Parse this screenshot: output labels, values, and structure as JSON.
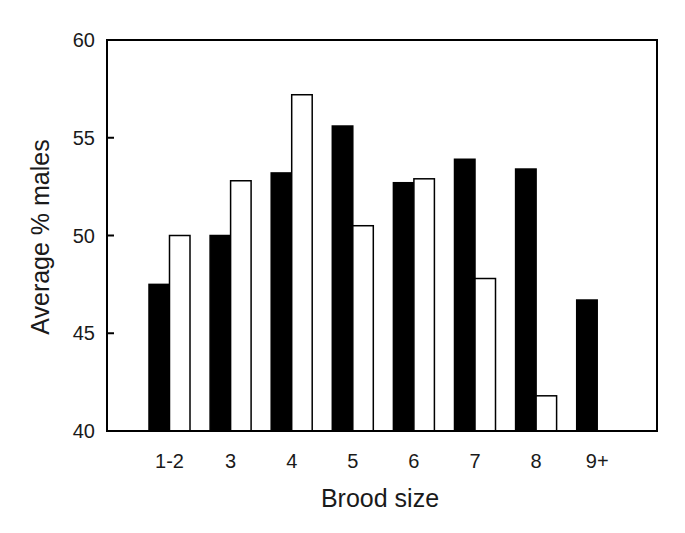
{
  "chart_data": {
    "type": "bar",
    "title": "",
    "xlabel": "Brood size",
    "ylabel": "Average % males",
    "ylim": [
      40,
      60
    ],
    "yticks": [
      40,
      45,
      50,
      55,
      60
    ],
    "grid": false,
    "legend": null,
    "categories": [
      "1-2",
      "3",
      "4",
      "5",
      "6",
      "7",
      "8",
      "9+"
    ],
    "series": [
      {
        "name": "Black bars",
        "fill": "#000000",
        "values": [
          47.5,
          50.0,
          53.2,
          55.6,
          52.7,
          53.9,
          53.4,
          46.7
        ]
      },
      {
        "name": "White bars",
        "fill": "#ffffff",
        "values": [
          50.0,
          52.8,
          57.2,
          50.5,
          52.9,
          47.8,
          41.8,
          null
        ]
      }
    ]
  },
  "layout": {
    "plot": {
      "left": 107,
      "top": 40,
      "right": 657,
      "bottom": 431
    },
    "first_group_x": 149,
    "group_step": 61.1,
    "bar_width": 20.5
  }
}
